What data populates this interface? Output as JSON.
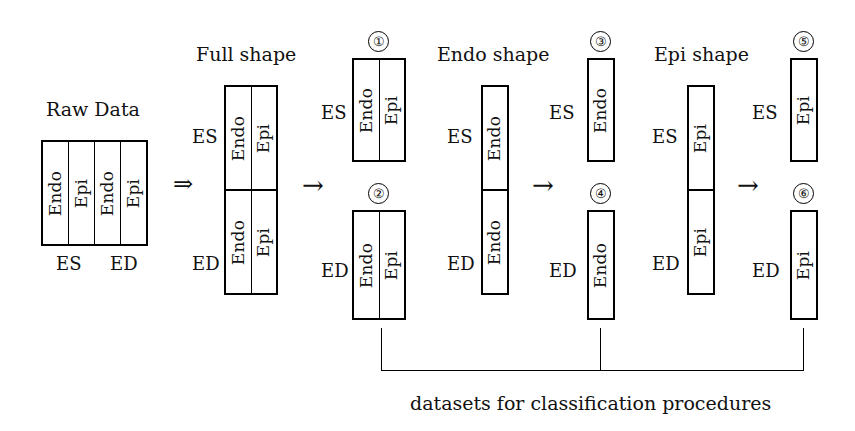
{
  "figure": {
    "caption": "datasets for classification procedures",
    "arrow_double": "⇒",
    "arrow_single": "→"
  },
  "groups": {
    "raw": {
      "title": "Raw Data",
      "columns": [
        "Endo",
        "Epi",
        "Endo",
        "Epi"
      ],
      "bottom_labels": [
        "ES",
        "ED"
      ]
    },
    "full": {
      "title": "Full shape",
      "row_labels": [
        "ES",
        "ED"
      ],
      "rows": [
        [
          "Endo",
          "Epi"
        ],
        [
          "Endo",
          "Epi"
        ]
      ]
    },
    "endo": {
      "title": "Endo shape",
      "row_labels": [
        "ES",
        "ED"
      ],
      "rows": [
        [
          "Endo"
        ],
        [
          "Endo"
        ]
      ]
    },
    "epi": {
      "title": "Epi shape",
      "row_labels": [
        "ES",
        "ED"
      ],
      "rows": [
        [
          "Epi"
        ],
        [
          "Epi"
        ]
      ]
    }
  },
  "datasets": [
    {
      "id": "1",
      "number": "①",
      "label": "ES",
      "cells": [
        "Endo",
        "Epi"
      ]
    },
    {
      "id": "2",
      "number": "②",
      "label": "ED",
      "cells": [
        "Endo",
        "Epi"
      ]
    },
    {
      "id": "3",
      "number": "③",
      "label": "ES",
      "cells": [
        "Endo"
      ]
    },
    {
      "id": "4",
      "number": "④",
      "label": "ED",
      "cells": [
        "Endo"
      ]
    },
    {
      "id": "5",
      "number": "⑤",
      "label": "ES",
      "cells": [
        "Epi"
      ]
    },
    {
      "id": "6",
      "number": "⑥",
      "label": "ED",
      "cells": [
        "Epi"
      ]
    }
  ]
}
